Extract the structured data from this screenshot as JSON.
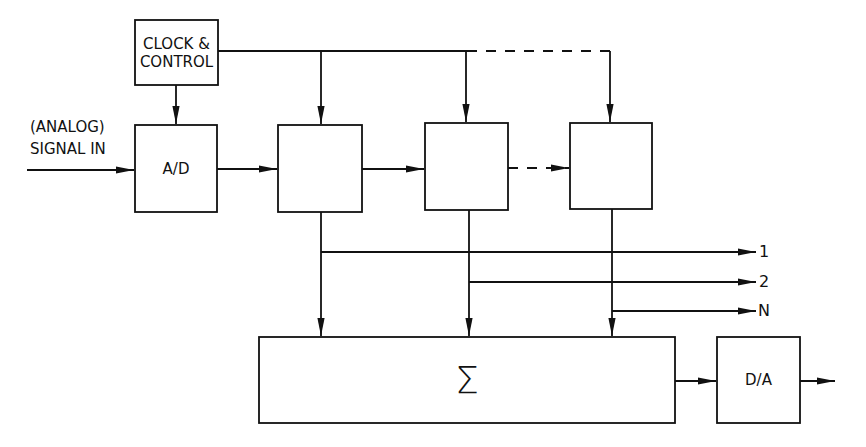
{
  "diagram": {
    "type": "block-diagram",
    "blocks": {
      "clock": {
        "line1": "CLOCK &",
        "line2": "CONTROL"
      },
      "adc": {
        "label": "A/D"
      },
      "delays": [
        {
          "index": "1",
          "label": "Z",
          "exp": "-1"
        },
        {
          "index": "2",
          "label": "Z",
          "exp": "-1"
        },
        {
          "index": "N",
          "label": "Z",
          "exp": "-1"
        }
      ],
      "summer": {
        "label": "Σ"
      },
      "dac": {
        "label": "D/A"
      }
    },
    "input": {
      "line1": "(ANALOG)",
      "line2": "SIGNAL IN"
    },
    "tap_outputs": [
      "1",
      "2",
      "N"
    ]
  }
}
